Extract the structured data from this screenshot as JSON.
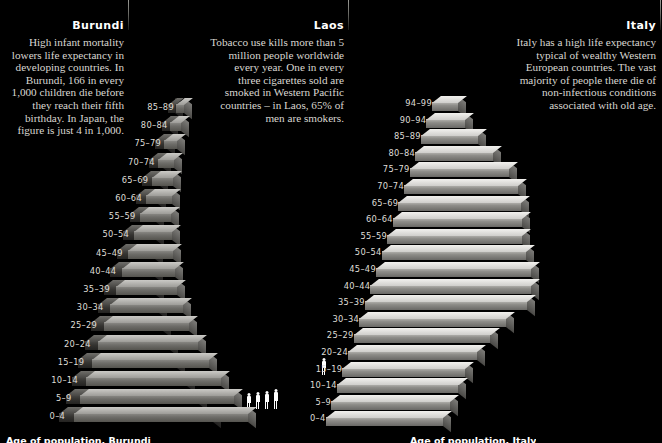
{
  "page": {
    "background_color": "#000000",
    "text_color": "#e8e6e0",
    "bar_light_color": "#b9b8b4",
    "bar_dark_color": "#3d3c39"
  },
  "panels": [
    {
      "id": "burundi",
      "title": "Burundi",
      "body": "High infant mortality lowers life expectancy in developing countries. In Burundi, 166 in every 1,000 children die before they reach their fifth birthday. In Japan, the figure is just 4 in 1,000.",
      "footer": "Age of population, Burundi"
    },
    {
      "id": "laos",
      "title": "Laos",
      "body": "Tobacco use kills more than 5 million people worldwide every year. One in every three cigarettes sold are smoked in Western Pacific countries – in Laos, 65% of men are smokers.",
      "footer": ""
    },
    {
      "id": "italy",
      "title": "Italy",
      "body": "Italy has a high life expectancy typical of wealthy Western European countries. The vast majority of people there die of non-infectious conditions associated with old age.",
      "footer": "Age of population, Italy"
    }
  ],
  "chart_data": [
    {
      "type": "bar",
      "title": "Age of population, Burundi",
      "xlabel": "",
      "ylabel": "Age group",
      "orientation": "horizontal",
      "categories": [
        "0–4",
        "5–9",
        "10–14",
        "15–19",
        "20–24",
        "25–29",
        "30–34",
        "35–39",
        "40–44",
        "45–49",
        "50–54",
        "55–59",
        "60–64",
        "65–69",
        "70–74",
        "75–79",
        "80–84",
        "85–89"
      ],
      "values": [
        100,
        86,
        74,
        63,
        54,
        45,
        38,
        32,
        27,
        23,
        19,
        15,
        12,
        9,
        7,
        5,
        3,
        2
      ],
      "grid": false,
      "legend": "none"
    },
    {
      "type": "bar",
      "title": "Age of population, Laos",
      "xlabel": "",
      "ylabel": "Age group",
      "orientation": "horizontal",
      "categories": [
        "0–4",
        "5–9",
        "10–14",
        "15–19",
        "20–24",
        "25–29",
        "30–34",
        "35–39",
        "40–44",
        "45–49",
        "50–54",
        "55–59",
        "60–64",
        "65–69",
        "70–74",
        "75–79",
        "80–84",
        "85–89"
      ],
      "values": [
        100,
        88,
        77,
        66,
        56,
        47,
        40,
        33,
        28,
        23,
        19,
        15,
        12,
        9,
        6,
        4,
        3,
        1
      ],
      "grid": false,
      "legend": "none"
    },
    {
      "type": "bar",
      "title": "Age of population, Italy",
      "xlabel": "",
      "ylabel": "Age group",
      "orientation": "horizontal",
      "categories": [
        "0–4",
        "5–9",
        "10–14",
        "15–19",
        "20–24",
        "25–29",
        "30–34",
        "35–39",
        "40–44",
        "45–49",
        "50–54",
        "55–59",
        "60–64",
        "65–69",
        "70–74",
        "75–79",
        "80–84",
        "85–89",
        "90–94",
        "94–99"
      ],
      "values": [
        70,
        71,
        73,
        74,
        78,
        83,
        90,
        100,
        99,
        95,
        88,
        82,
        78,
        74,
        68,
        58,
        44,
        30,
        18,
        9
      ],
      "grid": false,
      "legend": "none"
    }
  ],
  "age_labels": {
    "burundi": [
      "85–89",
      "80–84",
      "75–79",
      "70–74",
      "65–69",
      "60–64",
      "55–59",
      "50–54",
      "45–49",
      "40–44",
      "35–39",
      "30–34",
      "25–29",
      "20–24",
      "15–19",
      "10–14",
      "5–9",
      "0–4"
    ],
    "italy": [
      "94–99",
      "90–94",
      "85–89",
      "80–84",
      "75–79",
      "70–74",
      "65–69",
      "60–64",
      "55–59",
      "50–54",
      "45–49",
      "40–44",
      "35–39",
      "30–34",
      "25–29",
      "20–24",
      "15–19",
      "10–14",
      "5–9",
      "0–4"
    ]
  },
  "figures": {
    "walking_figure_count": 1,
    "standing_group_count": 5
  }
}
